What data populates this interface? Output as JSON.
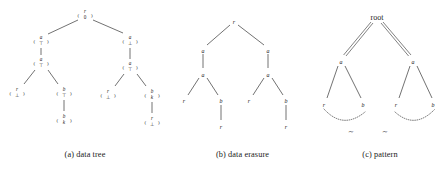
{
  "figure": {
    "panels": [
      {
        "id": "a",
        "caption": "(a) data tree",
        "type": "data-tree",
        "node_format": "vector",
        "nodes": [
          {
            "id": "a0",
            "top": "r",
            "bottom": "0",
            "x": 85,
            "y": 14
          },
          {
            "id": "a1",
            "top": "a",
            "bottom": "⊤",
            "x": 41,
            "y": 40
          },
          {
            "id": "a2",
            "top": "a",
            "bottom": "⊤",
            "x": 41,
            "y": 62
          },
          {
            "id": "a3",
            "top": "r",
            "bottom": "⊥",
            "x": 17,
            "y": 92
          },
          {
            "id": "a4",
            "top": "b",
            "bottom": "⊤",
            "x": 64,
            "y": 92
          },
          {
            "id": "a5",
            "top": "b",
            "bottom": "k",
            "x": 64,
            "y": 119
          },
          {
            "id": "a6",
            "top": "a",
            "bottom": "⊥",
            "x": 130,
            "y": 40
          },
          {
            "id": "a7",
            "top": "a",
            "bottom": "⊤",
            "x": 130,
            "y": 66
          },
          {
            "id": "a8",
            "top": "r",
            "bottom": "⊥",
            "x": 108,
            "y": 94
          },
          {
            "id": "a9",
            "top": "b",
            "bottom": "k",
            "x": 152,
            "y": 94
          },
          {
            "id": "a10",
            "top": "r",
            "bottom": "⊥",
            "x": 152,
            "y": 121
          }
        ],
        "edges": [
          {
            "from": "a0",
            "to": "a1",
            "style": "diagonal"
          },
          {
            "from": "a1",
            "to": "a2",
            "style": "vertical"
          },
          {
            "from": "a2",
            "to": "a3",
            "style": "diagonal"
          },
          {
            "from": "a2",
            "to": "a4",
            "style": "diagonal"
          },
          {
            "from": "a4",
            "to": "a5",
            "style": "vertical"
          },
          {
            "from": "a0",
            "to": "a6",
            "style": "diagonal"
          },
          {
            "from": "a6",
            "to": "a7",
            "style": "vertical"
          },
          {
            "from": "a7",
            "to": "a8",
            "style": "diagonal"
          },
          {
            "from": "a7",
            "to": "a9",
            "style": "diagonal"
          },
          {
            "from": "a9",
            "to": "a10",
            "style": "vertical"
          }
        ]
      },
      {
        "id": "b",
        "caption": "(b) data erasure",
        "type": "plain-tree",
        "nodes": [
          {
            "id": "b0",
            "label": "r",
            "x": 64,
            "y": 22
          },
          {
            "id": "b1",
            "label": "a",
            "x": 33,
            "y": 51
          },
          {
            "id": "b2",
            "label": "a",
            "x": 33,
            "y": 75
          },
          {
            "id": "b3",
            "label": "r",
            "x": 14,
            "y": 101
          },
          {
            "id": "b4",
            "label": "b",
            "x": 51,
            "y": 101
          },
          {
            "id": "b5",
            "label": "r",
            "x": 51,
            "y": 127
          },
          {
            "id": "b6",
            "label": "a",
            "x": 98,
            "y": 51
          },
          {
            "id": "b7",
            "label": "a",
            "x": 98,
            "y": 75
          },
          {
            "id": "b8",
            "label": "r",
            "x": 79,
            "y": 101
          },
          {
            "id": "b9",
            "label": "b",
            "x": 116,
            "y": 101
          },
          {
            "id": "b10",
            "label": "r",
            "x": 116,
            "y": 127
          }
        ],
        "edges": [
          {
            "from": "b0",
            "to": "b1",
            "style": "diagonal"
          },
          {
            "from": "b1",
            "to": "b2",
            "style": "vertical"
          },
          {
            "from": "b2",
            "to": "b3",
            "style": "diagonal"
          },
          {
            "from": "b2",
            "to": "b4",
            "style": "diagonal"
          },
          {
            "from": "b4",
            "to": "b5",
            "style": "vertical"
          },
          {
            "from": "b0",
            "to": "b6",
            "style": "diagonal"
          },
          {
            "from": "b6",
            "to": "b7",
            "style": "vertical"
          },
          {
            "from": "b7",
            "to": "b8",
            "style": "diagonal"
          },
          {
            "from": "b7",
            "to": "b9",
            "style": "diagonal"
          },
          {
            "from": "b9",
            "to": "b10",
            "style": "vertical"
          }
        ]
      },
      {
        "id": "c",
        "caption": "(c) pattern",
        "type": "pattern-tree",
        "root_label": "root",
        "nodes": [
          {
            "id": "c0",
            "label": "root",
            "x": 62,
            "y": 17
          },
          {
            "id": "c1",
            "label": "a",
            "x": 26,
            "y": 62
          },
          {
            "id": "c2",
            "label": "r",
            "x": 9,
            "y": 105
          },
          {
            "id": "c3",
            "label": "b",
            "x": 48,
            "y": 105
          },
          {
            "id": "c4",
            "label": "a",
            "x": 98,
            "y": 62
          },
          {
            "id": "c5",
            "label": "r",
            "x": 81,
            "y": 105
          },
          {
            "id": "c6",
            "label": "b",
            "x": 118,
            "y": 105
          }
        ],
        "edges": [
          {
            "from": "c0",
            "to": "c1",
            "style": "double"
          },
          {
            "from": "c0",
            "to": "c4",
            "style": "double"
          },
          {
            "from": "c1",
            "to": "c2",
            "style": "single"
          },
          {
            "from": "c1",
            "to": "c3",
            "style": "single"
          },
          {
            "from": "c4",
            "to": "c5",
            "style": "single"
          },
          {
            "from": "c4",
            "to": "c6",
            "style": "single"
          }
        ],
        "similarity_links": [
          {
            "id": "sim1",
            "label": "∼",
            "from": "c2",
            "to": "c3",
            "label_x": 36,
            "label_y": 133
          },
          {
            "id": "sim2",
            "label": "∼",
            "from": "c5",
            "to": "c6",
            "label_x": 70,
            "label_y": 133
          }
        ]
      }
    ]
  }
}
